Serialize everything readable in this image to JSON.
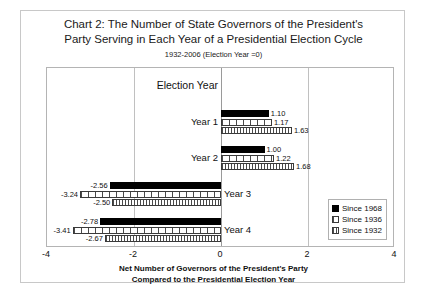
{
  "chart_data": {
    "type": "bar",
    "orientation": "horizontal",
    "title": "Chart 2: The Number of State Governors of the President's Party Serving in Each Year of a Presidential Election Cycle",
    "title_line1": "Chart 2: The Number of State Governors of the President's",
    "title_line2": "Party Serving in Each Year of a Presidential Election Cycle",
    "subtitle": "1932-2006  (Election Year =0)",
    "xlabel_line1": "Net Number of Governors of the President's Party",
    "xlabel_line2": "Compared to the Presidential Election Year",
    "ylabel": "",
    "categories": [
      "Election Year",
      "Year 1",
      "Year 2",
      "Year 3",
      "Year 4"
    ],
    "xlim": [
      -4,
      4
    ],
    "xticks": [
      -4,
      -2,
      0,
      2,
      4
    ],
    "xticklabels": [
      "-4",
      "-2",
      "0",
      "2",
      "4"
    ],
    "grid": true,
    "legend_position": "bottom-right",
    "series": [
      {
        "name": "Since 1968",
        "fill": "solid-black",
        "values": [
          0,
          1.1,
          1.0,
          -2.56,
          -2.78
        ],
        "labels": [
          "",
          "1.10",
          "1.00",
          "-2.56",
          "-2.78"
        ]
      },
      {
        "name": "Since 1936",
        "fill": "coarse-vertical-hatch",
        "values": [
          0,
          1.17,
          1.22,
          -3.24,
          -3.41
        ],
        "labels": [
          "",
          "1.17",
          "1.22",
          "-3.24",
          "-3.41"
        ]
      },
      {
        "name": "Since 1932",
        "fill": "fine-vertical-hatch",
        "values": [
          0,
          1.63,
          1.68,
          -2.5,
          -2.67
        ],
        "labels": [
          "",
          "1.63",
          "1.68",
          "-2.50",
          "-2.67"
        ]
      }
    ]
  },
  "legend": {
    "items": [
      {
        "label": "Since 1968"
      },
      {
        "label": "Since 1936"
      },
      {
        "label": "Since 1932"
      }
    ]
  },
  "colors": {
    "series1": "#000000",
    "series2": "#ffffff",
    "series3": "#ffffff",
    "frame": "#c8c8c8",
    "plot_border": "#b4b4b4",
    "gridline": "#c0c0c0",
    "text": "#111111",
    "background": "#ffffff"
  }
}
